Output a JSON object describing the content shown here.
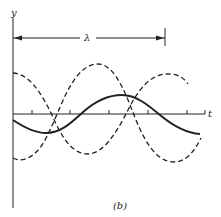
{
  "figure": {
    "label": "(b)",
    "axes": {
      "y_label": "y",
      "x_label": "t"
    },
    "wavelength_marker": {
      "symbol": "λ",
      "description": "double-headed arrow spanning one wavelength from y-axis to vertical tick"
    },
    "curves": [
      {
        "name": "dashed-wave-1",
        "style": "dashed",
        "shape": "cosine-like, starts high, dips, rises to peak near right"
      },
      {
        "name": "dashed-wave-2",
        "style": "dashed",
        "shape": "starts low, peaks mid-left, dips near right"
      },
      {
        "name": "solid-wave",
        "style": "solid",
        "shape": "smaller amplitude sum, starts slightly below axis, peaks mid-right"
      }
    ],
    "colors": {
      "ink": "#222222",
      "background": "#ffffff"
    }
  }
}
